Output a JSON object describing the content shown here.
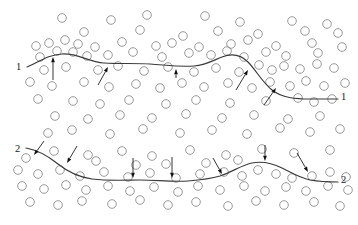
{
  "figure": {
    "type": "technical-diagram",
    "background_color": "#ffffff",
    "width": 358,
    "height": 225,
    "particle_color": "#8c8c8c",
    "boundary_color": "#3a3a3a",
    "arrow_color": "#111111",
    "particle_radius": 4.3
  },
  "labels": {
    "boundary1_left": "1",
    "boundary1_right": "1",
    "boundary2_left": "2",
    "boundary2_right": "2"
  },
  "label_positions": [
    {
      "name": "boundary1-left-label",
      "text": "1",
      "x": 16,
      "y": 70
    },
    {
      "name": "boundary1-right-label",
      "text": "1",
      "x": 341,
      "y": 100
    },
    {
      "name": "boundary2-left-label",
      "text": "2",
      "x": 15,
      "y": 152
    },
    {
      "name": "boundary2-right-label",
      "text": "2",
      "x": 341,
      "y": 183
    }
  ],
  "boundaries": [
    {
      "name": "boundary-1",
      "label": "1",
      "path": "M 27 67 C 40 62 46 55 62 54 C 78 53 88 62 104 63 C 120 64 134 63 150 64 C 166 65 178 67 194 66 C 206 65 214 60 222 57 C 232 53 240 54 248 62 C 256 70 262 82 272 90 C 282 98 296 99 310 99 C 322 99 332 99 338 99"
    },
    {
      "name": "boundary-2",
      "label": "2",
      "path": "M 26 148 C 38 150 48 156 58 164 C 68 172 78 177 92 179 C 108 181 124 180 140 180 C 156 180 172 182 188 181 C 200 180 210 179 220 176 C 232 172 242 165 252 163 C 262 161 272 163 282 168 C 292 173 300 178 310 180 C 322 182 332 182 338 182"
    }
  ],
  "arrows": [
    {
      "name": "arrow-up-1",
      "x1": 53,
      "y1": 80,
      "x2": 53,
      "y2": 57,
      "direction": "up"
    },
    {
      "name": "arrow-up-2",
      "x1": 98,
      "y1": 85,
      "x2": 108,
      "y2": 67,
      "direction": "up-right"
    },
    {
      "name": "arrow-up-3",
      "x1": 176,
      "y1": 78,
      "x2": 176,
      "y2": 69,
      "direction": "up"
    },
    {
      "name": "arrow-up-4",
      "x1": 236,
      "y1": 90,
      "x2": 248,
      "y2": 70,
      "direction": "up-right"
    },
    {
      "name": "arrow-up-5",
      "x1": 264,
      "y1": 105,
      "x2": 276,
      "y2": 88,
      "direction": "up-right"
    },
    {
      "name": "arrow-down-1",
      "x1": 44,
      "y1": 141,
      "x2": 34,
      "y2": 155,
      "direction": "down-left"
    },
    {
      "name": "arrow-down-2",
      "x1": 77,
      "y1": 146,
      "x2": 67,
      "y2": 163,
      "direction": "down-left"
    },
    {
      "name": "arrow-down-3",
      "x1": 133,
      "y1": 158,
      "x2": 133,
      "y2": 178,
      "direction": "down"
    },
    {
      "name": "arrow-down-4",
      "x1": 172,
      "y1": 157,
      "x2": 172,
      "y2": 178,
      "direction": "down"
    },
    {
      "name": "arrow-down-5",
      "x1": 213,
      "y1": 158,
      "x2": 222,
      "y2": 174,
      "direction": "down-right"
    },
    {
      "name": "arrow-down-6",
      "x1": 265,
      "y1": 145,
      "x2": 265,
      "y2": 161,
      "direction": "down"
    },
    {
      "name": "arrow-down-7",
      "x1": 297,
      "y1": 153,
      "x2": 308,
      "y2": 172,
      "direction": "down-right"
    }
  ],
  "particles": [
    {
      "x": 62,
      "y": 18
    },
    {
      "x": 111,
      "y": 20
    },
    {
      "x": 147,
      "y": 15
    },
    {
      "x": 205,
      "y": 16
    },
    {
      "x": 240,
      "y": 22
    },
    {
      "x": 292,
      "y": 21
    },
    {
      "x": 327,
      "y": 24
    },
    {
      "x": 84,
      "y": 32
    },
    {
      "x": 140,
      "y": 30
    },
    {
      "x": 183,
      "y": 36
    },
    {
      "x": 218,
      "y": 31
    },
    {
      "x": 258,
      "y": 34
    },
    {
      "x": 305,
      "y": 31
    },
    {
      "x": 338,
      "y": 33
    },
    {
      "x": 36,
      "y": 46
    },
    {
      "x": 49,
      "y": 43
    },
    {
      "x": 65,
      "y": 40
    },
    {
      "x": 78,
      "y": 44
    },
    {
      "x": 95,
      "y": 47
    },
    {
      "x": 122,
      "y": 42
    },
    {
      "x": 156,
      "y": 46
    },
    {
      "x": 172,
      "y": 43
    },
    {
      "x": 199,
      "y": 47
    },
    {
      "x": 231,
      "y": 44
    },
    {
      "x": 248,
      "y": 40
    },
    {
      "x": 276,
      "y": 46
    },
    {
      "x": 312,
      "y": 43
    },
    {
      "x": 342,
      "y": 47
    },
    {
      "x": 40,
      "y": 57
    },
    {
      "x": 57,
      "y": 51
    },
    {
      "x": 73,
      "y": 52
    },
    {
      "x": 87,
      "y": 56
    },
    {
      "x": 108,
      "y": 55
    },
    {
      "x": 133,
      "y": 52
    },
    {
      "x": 162,
      "y": 57
    },
    {
      "x": 189,
      "y": 53
    },
    {
      "x": 211,
      "y": 55
    },
    {
      "x": 227,
      "y": 51
    },
    {
      "x": 244,
      "y": 57
    },
    {
      "x": 266,
      "y": 52
    },
    {
      "x": 286,
      "y": 56
    },
    {
      "x": 318,
      "y": 53
    },
    {
      "x": 44,
      "y": 70
    },
    {
      "x": 66,
      "y": 67
    },
    {
      "x": 98,
      "y": 70
    },
    {
      "x": 118,
      "y": 66
    },
    {
      "x": 144,
      "y": 71
    },
    {
      "x": 168,
      "y": 67
    },
    {
      "x": 194,
      "y": 72
    },
    {
      "x": 216,
      "y": 68
    },
    {
      "x": 239,
      "y": 72
    },
    {
      "x": 259,
      "y": 65
    },
    {
      "x": 272,
      "y": 70
    },
    {
      "x": 284,
      "y": 66
    },
    {
      "x": 300,
      "y": 69
    },
    {
      "x": 317,
      "y": 64
    },
    {
      "x": 334,
      "y": 68
    },
    {
      "x": 30,
      "y": 82
    },
    {
      "x": 52,
      "y": 86
    },
    {
      "x": 84,
      "y": 82
    },
    {
      "x": 109,
      "y": 87
    },
    {
      "x": 136,
      "y": 84
    },
    {
      "x": 160,
      "y": 88
    },
    {
      "x": 182,
      "y": 83
    },
    {
      "x": 204,
      "y": 87
    },
    {
      "x": 228,
      "y": 83
    },
    {
      "x": 252,
      "y": 88
    },
    {
      "x": 270,
      "y": 82
    },
    {
      "x": 290,
      "y": 86
    },
    {
      "x": 306,
      "y": 81
    },
    {
      "x": 324,
      "y": 86
    },
    {
      "x": 345,
      "y": 83
    },
    {
      "x": 38,
      "y": 99
    },
    {
      "x": 73,
      "y": 101
    },
    {
      "x": 100,
      "y": 104
    },
    {
      "x": 129,
      "y": 100
    },
    {
      "x": 166,
      "y": 104
    },
    {
      "x": 196,
      "y": 100
    },
    {
      "x": 230,
      "y": 103
    },
    {
      "x": 266,
      "y": 101
    },
    {
      "x": 298,
      "y": 98
    },
    {
      "x": 314,
      "y": 102
    },
    {
      "x": 332,
      "y": 99
    },
    {
      "x": 55,
      "y": 116
    },
    {
      "x": 88,
      "y": 119
    },
    {
      "x": 120,
      "y": 115
    },
    {
      "x": 152,
      "y": 118
    },
    {
      "x": 186,
      "y": 114
    },
    {
      "x": 222,
      "y": 118
    },
    {
      "x": 254,
      "y": 115
    },
    {
      "x": 288,
      "y": 119
    },
    {
      "x": 320,
      "y": 116
    },
    {
      "x": 48,
      "y": 133
    },
    {
      "x": 72,
      "y": 130
    },
    {
      "x": 110,
      "y": 134
    },
    {
      "x": 143,
      "y": 129
    },
    {
      "x": 180,
      "y": 133
    },
    {
      "x": 212,
      "y": 130
    },
    {
      "x": 247,
      "y": 134
    },
    {
      "x": 280,
      "y": 128
    },
    {
      "x": 310,
      "y": 132
    },
    {
      "x": 340,
      "y": 129
    },
    {
      "x": 26,
      "y": 158
    },
    {
      "x": 54,
      "y": 151
    },
    {
      "x": 88,
      "y": 155
    },
    {
      "x": 122,
      "y": 151
    },
    {
      "x": 152,
      "y": 156
    },
    {
      "x": 190,
      "y": 150
    },
    {
      "x": 226,
      "y": 155
    },
    {
      "x": 262,
      "y": 149
    },
    {
      "x": 294,
      "y": 153
    },
    {
      "x": 330,
      "y": 150
    },
    {
      "x": 18,
      "y": 170
    },
    {
      "x": 38,
      "y": 174
    },
    {
      "x": 60,
      "y": 170
    },
    {
      "x": 80,
      "y": 176
    },
    {
      "x": 104,
      "y": 172
    },
    {
      "x": 128,
      "y": 177
    },
    {
      "x": 150,
      "y": 173
    },
    {
      "x": 176,
      "y": 178
    },
    {
      "x": 200,
      "y": 174
    },
    {
      "x": 224,
      "y": 172
    },
    {
      "x": 242,
      "y": 176
    },
    {
      "x": 258,
      "y": 170
    },
    {
      "x": 276,
      "y": 174
    },
    {
      "x": 292,
      "y": 178
    },
    {
      "x": 312,
      "y": 176
    },
    {
      "x": 330,
      "y": 172
    },
    {
      "x": 346,
      "y": 177
    },
    {
      "x": 22,
      "y": 186
    },
    {
      "x": 44,
      "y": 189
    },
    {
      "x": 66,
      "y": 185
    },
    {
      "x": 86,
      "y": 190
    },
    {
      "x": 108,
      "y": 186
    },
    {
      "x": 130,
      "y": 191
    },
    {
      "x": 154,
      "y": 187
    },
    {
      "x": 178,
      "y": 192
    },
    {
      "x": 198,
      "y": 186
    },
    {
      "x": 220,
      "y": 190
    },
    {
      "x": 244,
      "y": 186
    },
    {
      "x": 265,
      "y": 191
    },
    {
      "x": 286,
      "y": 187
    },
    {
      "x": 306,
      "y": 191
    },
    {
      "x": 328,
      "y": 186
    },
    {
      "x": 348,
      "y": 190
    },
    {
      "x": 30,
      "y": 202
    },
    {
      "x": 58,
      "y": 205
    },
    {
      "x": 82,
      "y": 201
    },
    {
      "x": 112,
      "y": 204
    },
    {
      "x": 140,
      "y": 200
    },
    {
      "x": 168,
      "y": 205
    },
    {
      "x": 196,
      "y": 202
    },
    {
      "x": 228,
      "y": 206
    },
    {
      "x": 256,
      "y": 201
    },
    {
      "x": 284,
      "y": 205
    },
    {
      "x": 314,
      "y": 202
    },
    {
      "x": 340,
      "y": 206
    },
    {
      "x": 96,
      "y": 161
    },
    {
      "x": 206,
      "y": 163
    },
    {
      "x": 238,
      "y": 160
    },
    {
      "x": 166,
      "y": 164
    },
    {
      "x": 136,
      "y": 165
    }
  ]
}
